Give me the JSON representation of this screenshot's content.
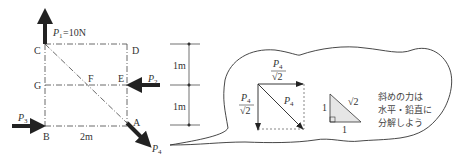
{
  "figure": {
    "points": {
      "C": "C",
      "D": "D",
      "G": "G",
      "F": "F",
      "E": "E",
      "B": "B",
      "A": "A"
    },
    "forces": {
      "p1_label": "P",
      "p1_sub": "1",
      "p1_value": "=10N",
      "p2_label": "P",
      "p2_sub": "2",
      "p3_label": "P",
      "p3_sub": "3",
      "p4_label": "P",
      "p4_sub": "4"
    },
    "dimensions": {
      "width": "2m",
      "upper_height": "1m",
      "lower_height": "1m"
    }
  },
  "bubble": {
    "decomposition": {
      "top_numer_label": "P",
      "top_numer_sub": "4",
      "top_denom": "√2",
      "left_numer_label": "P",
      "left_numer_sub": "4",
      "left_denom": "√2",
      "diag_label": "P",
      "diag_sub": "4"
    },
    "triangle": {
      "side_vertical": "1",
      "side_horizontal": "1",
      "hypotenuse": "√2"
    },
    "note_lines": [
      "斜めの力は",
      "水平・鉛直に",
      "分解しよう"
    ]
  },
  "colors": {
    "line": "#333333",
    "arrow": "#222222",
    "triangle_fill": "#e6e6e6"
  }
}
